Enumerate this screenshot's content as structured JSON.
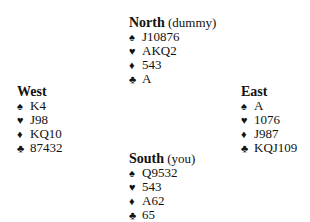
{
  "suit_symbols": {
    "spades": "♠",
    "hearts": "♥",
    "diamonds": "♦",
    "clubs": "♣"
  },
  "hands": {
    "north": {
      "name": "North",
      "role": " (dummy)",
      "spades": "J10876",
      "hearts": "AKQ2",
      "diamonds": "543",
      "clubs": "A"
    },
    "west": {
      "name": "West",
      "role": "",
      "spades": "K4",
      "hearts": "J98",
      "diamonds": "KQ10",
      "clubs": "87432"
    },
    "east": {
      "name": "East",
      "role": "",
      "spades": "A",
      "hearts": "1076",
      "diamonds": "J987",
      "clubs": "KQJ109"
    },
    "south": {
      "name": "South",
      "role": " (you)",
      "spades": "Q9532",
      "hearts": "543",
      "diamonds": "A62",
      "clubs": "65"
    }
  }
}
